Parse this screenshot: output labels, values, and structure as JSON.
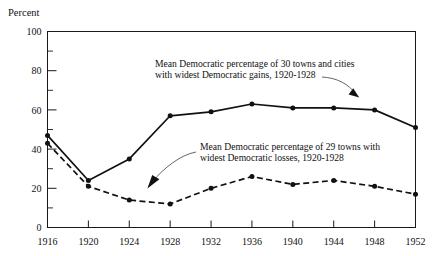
{
  "chart_data": {
    "type": "line",
    "title": "",
    "xlabel": "",
    "ylabel": "Percent",
    "ylim": [
      0,
      100
    ],
    "xlim": [
      1916,
      1952
    ],
    "grid": false,
    "legend_position": "inline-annotations",
    "categories": [
      1916,
      1920,
      1924,
      1928,
      1932,
      1936,
      1940,
      1944,
      1948,
      1952
    ],
    "x_tick_labels": [
      "1916",
      "1920",
      "1924",
      "1928",
      "1932",
      "1936",
      "1940",
      "1944",
      "1948",
      "1952"
    ],
    "y_tick_labels": [
      "0",
      "20",
      "40",
      "60",
      "80",
      "100"
    ],
    "y_ticks_major": [
      0,
      20,
      40,
      60,
      80,
      100
    ],
    "y_ticks_minor": [
      10,
      30,
      50,
      70,
      90
    ],
    "series": [
      {
        "name": "Mean Democratic percentage of 30 towns and cities with widest Democratic gains, 1920-1928",
        "style": "solid",
        "values": [
          47,
          24,
          35,
          57,
          59,
          63,
          61,
          61,
          60,
          51
        ]
      },
      {
        "name": "Mean Democratic percentage of 29 towns with widest Democratic losses, 1920-1928",
        "style": "dashed",
        "values": [
          43,
          21,
          14,
          12,
          20,
          26,
          22,
          24,
          21,
          17
        ]
      }
    ],
    "annotations": [
      {
        "id": "gains-annotation",
        "line1": "Mean Democratic percentage of 30 towns and cities",
        "line2": "with widest Democratic gains, 1920-1928",
        "points_to_year": 1948
      },
      {
        "id": "losses-annotation",
        "line1": "Mean Democratic percentage of 29 towns with",
        "line2": "widest Democratic losses, 1920-1928",
        "points_to_year": 1928
      }
    ]
  },
  "colors": {
    "ink": "#111111",
    "leader": "#555555",
    "background": "#ffffff"
  }
}
